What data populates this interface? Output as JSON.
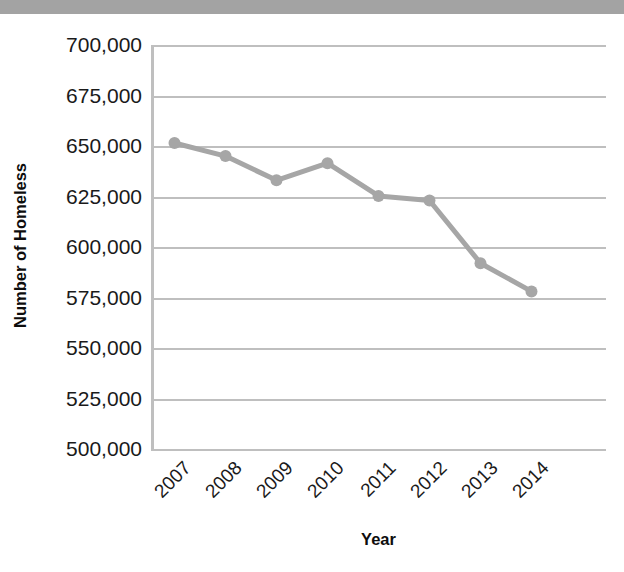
{
  "top_bar": {
    "color": "#a3a3a3"
  },
  "chart_data": {
    "type": "line",
    "title": "",
    "xlabel": "Year",
    "ylabel": "Number of Homeless",
    "categories": [
      "2007",
      "2008",
      "2009",
      "2010",
      "2011",
      "2012",
      "2013",
      "2014"
    ],
    "values": [
      651500,
      645000,
      633000,
      641500,
      625300,
      623000,
      592000,
      578000
    ],
    "series": [
      {
        "name": "Number of Homeless",
        "values": [
          651500,
          645000,
          633000,
          641500,
          625300,
          623000,
          592000,
          578000
        ]
      }
    ],
    "ylim": [
      500000,
      700000
    ],
    "ytick_step": 25000,
    "ytick_labels": [
      "700,000",
      "675,000",
      "650,000",
      "625,000",
      "600,000",
      "575,000",
      "550,000",
      "525,000",
      "500,000"
    ],
    "ytick_values": [
      700000,
      675000,
      650000,
      625000,
      600000,
      575000,
      550000,
      525000,
      500000
    ],
    "grid": true,
    "legend": "none",
    "line_color": "#a6a6a6",
    "marker_color": "#a6a6a6",
    "axis_color": "#bfbfbf",
    "line_width": 5,
    "marker_radius": 6,
    "xtick_rotation": -45
  }
}
